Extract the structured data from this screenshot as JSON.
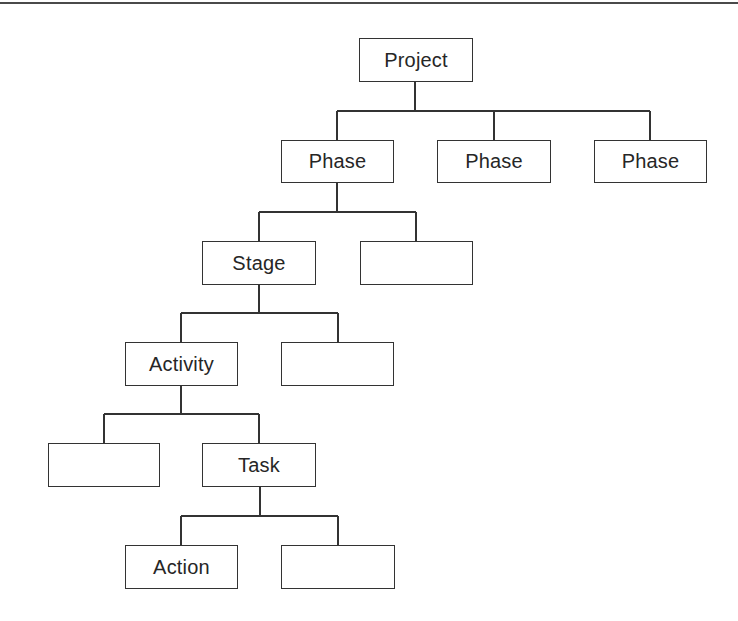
{
  "diagram": {
    "type": "hierarchy",
    "colors": {
      "line": "#333333",
      "text": "#262626",
      "background": "#ffffff",
      "rule": "#4a4a4a"
    },
    "nodes": [
      {
        "id": "project",
        "label": "Project",
        "level": 0
      },
      {
        "id": "phase-1",
        "label": "Phase",
        "level": 1,
        "parent": "project"
      },
      {
        "id": "phase-2",
        "label": "Phase",
        "level": 1,
        "parent": "project"
      },
      {
        "id": "phase-3",
        "label": "Phase",
        "level": 1,
        "parent": "project"
      },
      {
        "id": "stage",
        "label": "Stage",
        "level": 2,
        "parent": "phase-1"
      },
      {
        "id": "stage-sibling",
        "label": "",
        "level": 2,
        "parent": "phase-1"
      },
      {
        "id": "activity",
        "label": "Activity",
        "level": 3,
        "parent": "stage"
      },
      {
        "id": "activity-sibling",
        "label": "",
        "level": 3,
        "parent": "stage"
      },
      {
        "id": "task-sibling",
        "label": "",
        "level": 4,
        "parent": "activity"
      },
      {
        "id": "task",
        "label": "Task",
        "level": 4,
        "parent": "activity"
      },
      {
        "id": "action",
        "label": "Action",
        "level": 5,
        "parent": "task"
      },
      {
        "id": "action-sibling",
        "label": "",
        "level": 5,
        "parent": "task"
      }
    ]
  }
}
